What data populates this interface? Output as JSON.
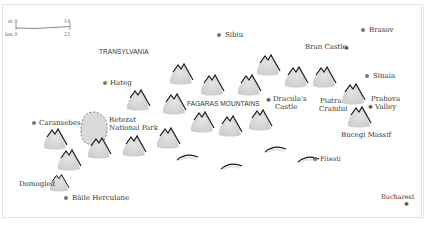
{
  "scale_bar": {
    "miles_label": "m 0",
    "miles_max": "14",
    "km_label": "km 0",
    "km_max": "21"
  },
  "regions": {
    "transylvania": "TRANSYLVANIA",
    "fagaras": "FAGARAS MOUNTAINS"
  },
  "towns": {
    "sibiu": "Sibiu",
    "brasov": "Brasov",
    "sinaia": "Sinaia",
    "hateg": "Hateg",
    "caransebes": "Caransebes",
    "pitesti": "Pitesti",
    "baile_herculane": "Băile Herculane"
  },
  "sights": {
    "bran_castle": "Bran Castle",
    "draculas_castle_1": "Dracula's",
    "draculas_castle_2": "Castle",
    "prahova_1": "Prahova",
    "prahova_2": "Valley",
    "bucharest": "Bucharest"
  },
  "peaks": {
    "piatra_1": "Piatra",
    "piatra_2": "Craiului",
    "bucegi": "Bucegi Massif",
    "domogled": "Domogled"
  },
  "park": {
    "line1": "Retezat",
    "line2": "National Park"
  },
  "colors": {
    "mountain_fill": "#d9d9d9",
    "mountain_line": "#1a1a1a",
    "border": "#e2e2e2",
    "dot": "#777777"
  }
}
